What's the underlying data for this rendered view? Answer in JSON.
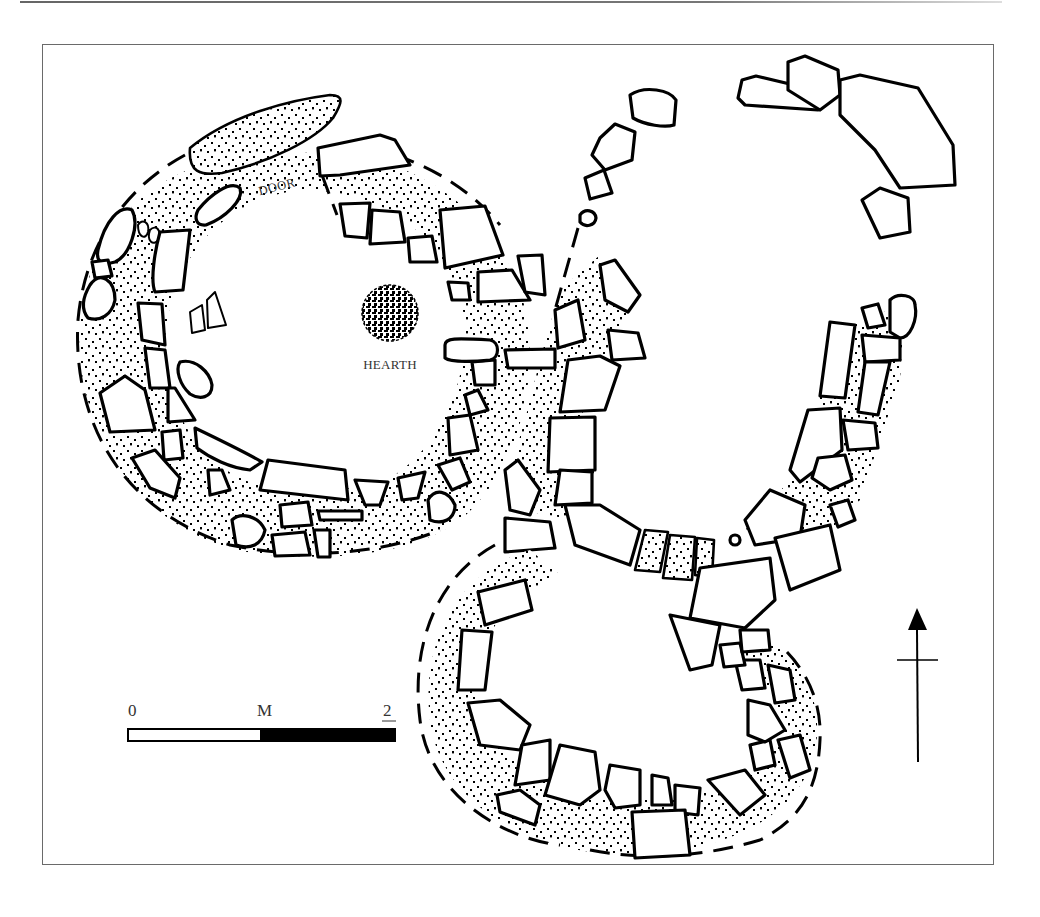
{
  "figure": {
    "type": "archaeological-site-plan",
    "labels": {
      "door": "DOOR",
      "hearth": "HEARTH"
    },
    "scale_bar": {
      "start_label": "0",
      "unit_label": "M",
      "end_label": "2",
      "segments": [
        {
          "fill": "#ffffff",
          "from": 0,
          "to": 1
        },
        {
          "fill": "#000000",
          "from": 1,
          "to": 2
        }
      ]
    },
    "north_arrow": {
      "direction": "north",
      "icon": "north-arrow-icon"
    },
    "structures": [
      {
        "name": "west-hut",
        "label": "circular hut with hearth and door"
      },
      {
        "name": "south-hut",
        "label": "lower oval enclosure"
      },
      {
        "name": "north-east-arc",
        "label": "partial stone arc"
      }
    ]
  }
}
